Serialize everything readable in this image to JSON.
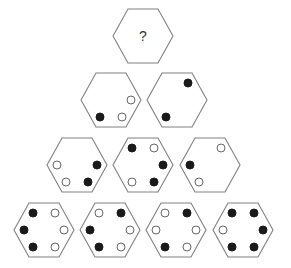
{
  "puzzle": {
    "type": "hexagon-dot-pyramid",
    "question_label": "?",
    "colors": {
      "outline": "#808080",
      "filled_dot": "#1a1a1a",
      "open_dot_stroke": "#666666",
      "background": "#ffffff"
    },
    "positions_legend": [
      "upper-left",
      "upper-right",
      "right",
      "lower-right",
      "lower-left",
      "left"
    ],
    "rows": [
      {
        "hexagons": [
          {
            "id": "r1-h1",
            "cx": 143,
            "cy": 36,
            "question": true,
            "dots": []
          }
        ]
      },
      {
        "hexagons": [
          {
            "id": "r2-h1",
            "cx": 111,
            "cy": 100,
            "question": false,
            "dots": [
              {
                "pos": "right",
                "filled": false
              },
              {
                "pos": "lower-right",
                "filled": false
              },
              {
                "pos": "lower-left",
                "filled": true
              }
            ]
          },
          {
            "id": "r2-h2",
            "cx": 177,
            "cy": 100,
            "question": false,
            "dots": [
              {
                "pos": "upper-right",
                "filled": true
              },
              {
                "pos": "lower-left",
                "filled": true
              }
            ]
          }
        ]
      },
      {
        "hexagons": [
          {
            "id": "r3-h1",
            "cx": 77,
            "cy": 165,
            "question": false,
            "dots": [
              {
                "pos": "left",
                "filled": false
              },
              {
                "pos": "right",
                "filled": true
              },
              {
                "pos": "lower-left",
                "filled": false
              },
              {
                "pos": "lower-right",
                "filled": true
              }
            ]
          },
          {
            "id": "r3-h2",
            "cx": 143,
            "cy": 165,
            "question": false,
            "dots": [
              {
                "pos": "upper-left",
                "filled": true
              },
              {
                "pos": "upper-right",
                "filled": false
              },
              {
                "pos": "right",
                "filled": true
              },
              {
                "pos": "lower-left",
                "filled": false
              },
              {
                "pos": "lower-right",
                "filled": true
              }
            ]
          },
          {
            "id": "r3-h3",
            "cx": 210,
            "cy": 165,
            "question": false,
            "dots": [
              {
                "pos": "upper-right",
                "filled": false
              },
              {
                "pos": "left",
                "filled": true
              },
              {
                "pos": "lower-left",
                "filled": false
              }
            ]
          }
        ]
      },
      {
        "hexagons": [
          {
            "id": "r4-h1",
            "cx": 44,
            "cy": 230,
            "question": false,
            "dots": [
              {
                "pos": "upper-left",
                "filled": true
              },
              {
                "pos": "upper-right",
                "filled": false
              },
              {
                "pos": "left",
                "filled": true
              },
              {
                "pos": "right",
                "filled": false
              },
              {
                "pos": "lower-left",
                "filled": true
              },
              {
                "pos": "lower-right",
                "filled": false
              }
            ]
          },
          {
            "id": "r4-h2",
            "cx": 110,
            "cy": 230,
            "question": false,
            "dots": [
              {
                "pos": "upper-left",
                "filled": false
              },
              {
                "pos": "upper-right",
                "filled": true
              },
              {
                "pos": "left",
                "filled": true
              },
              {
                "pos": "right",
                "filled": false
              },
              {
                "pos": "lower-left",
                "filled": true
              },
              {
                "pos": "lower-right",
                "filled": false
              }
            ]
          },
          {
            "id": "r4-h3",
            "cx": 176,
            "cy": 230,
            "question": false,
            "dots": [
              {
                "pos": "upper-left",
                "filled": false
              },
              {
                "pos": "upper-right",
                "filled": true
              },
              {
                "pos": "left",
                "filled": false
              },
              {
                "pos": "right",
                "filled": false
              },
              {
                "pos": "lower-left",
                "filled": true
              },
              {
                "pos": "lower-right",
                "filled": false
              }
            ]
          },
          {
            "id": "r4-h4",
            "cx": 243,
            "cy": 230,
            "question": false,
            "dots": [
              {
                "pos": "upper-left",
                "filled": true
              },
              {
                "pos": "upper-right",
                "filled": true
              },
              {
                "pos": "left",
                "filled": false
              },
              {
                "pos": "right",
                "filled": true
              },
              {
                "pos": "lower-left",
                "filled": true
              },
              {
                "pos": "lower-right",
                "filled": true
              }
            ]
          }
        ]
      }
    ]
  }
}
